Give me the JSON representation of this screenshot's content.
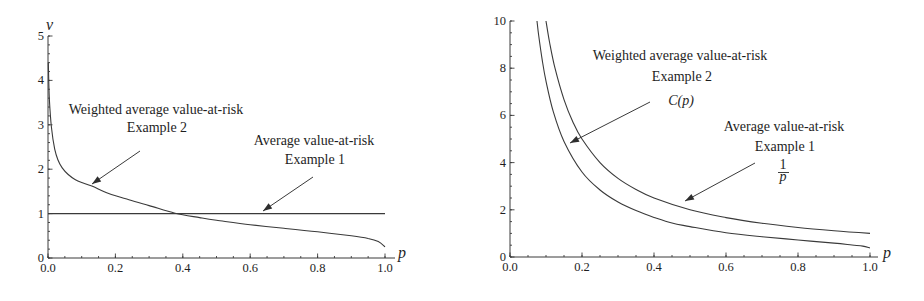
{
  "chart_data": [
    {
      "type": "line",
      "title": "",
      "xlabel": "p",
      "ylabel": "ν",
      "xlim": [
        0,
        1
      ],
      "ylim": [
        0,
        5
      ],
      "xticks": [
        0,
        0.2,
        0.4,
        0.6,
        0.8,
        1.0
      ],
      "xtick_labels": [
        "0.0",
        "0.2",
        "0.4",
        "0.6",
        "0.8",
        "1.0"
      ],
      "yticks": [
        0,
        1,
        2,
        3,
        4,
        5
      ],
      "ytick_labels": [
        "0",
        "1",
        "2",
        "3",
        "4",
        "5"
      ],
      "x_minor_step": 0.05,
      "y_minor_step": 0.2,
      "grid": false,
      "legend": "none",
      "series": [
        {
          "id": "weighted-avar-example-2",
          "name": "Weighted average value-at-risk (Example 2)",
          "x": [
            0.001,
            0.004,
            0.01,
            0.02,
            0.03,
            0.042,
            0.06,
            0.08,
            0.1,
            0.13,
            0.18,
            0.24,
            0.3,
            0.377,
            0.45,
            0.5,
            0.6,
            0.7,
            0.8,
            0.9,
            0.95,
            0.98,
            1.0
          ],
          "y": [
            4.4,
            3.6,
            2.95,
            2.45,
            2.2,
            2.03,
            1.88,
            1.77,
            1.7,
            1.62,
            1.45,
            1.31,
            1.18,
            1.01,
            0.91,
            0.85,
            0.75,
            0.67,
            0.59,
            0.5,
            0.44,
            0.37,
            0.25
          ]
        },
        {
          "id": "avar-example-1",
          "name": "Average value-at-risk (Example 1)",
          "x": [
            0,
            1
          ],
          "y": [
            1,
            1
          ]
        }
      ],
      "annotations": [
        {
          "lines": [
            "Weighted average value-at-risk",
            "Example 2"
          ],
          "points_to": "weighted-avar-example-2"
        },
        {
          "lines": [
            "Average value-at-risk",
            "Example 1"
          ],
          "points_to": "avar-example-1"
        }
      ]
    },
    {
      "type": "line",
      "title": "",
      "xlabel": "p",
      "ylabel": "",
      "xlim": [
        0,
        1
      ],
      "ylim": [
        0,
        10
      ],
      "xticks": [
        0,
        0.2,
        0.4,
        0.6,
        0.8,
        1.0
      ],
      "xtick_labels": [
        "0.0",
        "0.2",
        "0.4",
        "0.6",
        "0.8",
        "1.0"
      ],
      "yticks": [
        0,
        2,
        4,
        6,
        8,
        10
      ],
      "ytick_labels": [
        "0",
        "2",
        "4",
        "6",
        "8",
        "10"
      ],
      "x_minor_step": 0.05,
      "y_minor_step": 0.5,
      "grid": false,
      "legend": "none",
      "series": [
        {
          "id": "weighted-avar-example-2-Cp",
          "name": "Weighted average value-at-risk (Example 2): C(p)",
          "x": [
            0.075,
            0.08,
            0.09,
            0.1,
            0.12,
            0.15,
            0.2,
            0.25,
            0.3,
            0.35,
            0.4,
            0.45,
            0.5,
            0.6,
            0.7,
            0.8,
            0.9,
            0.95,
            0.98,
            1.0
          ],
          "y": [
            10.0,
            9.35,
            8.3,
            7.45,
            6.17,
            4.9,
            3.6,
            2.84,
            2.33,
            1.97,
            1.68,
            1.44,
            1.29,
            1.03,
            0.86,
            0.72,
            0.59,
            0.51,
            0.46,
            0.38
          ]
        },
        {
          "id": "avar-example-1-inverse-p",
          "name": "Average value-at-risk (Example 1): 1/p",
          "x": [
            0.1,
            0.11,
            0.125,
            0.15,
            0.175,
            0.2,
            0.25,
            0.3,
            0.35,
            0.4,
            0.5,
            0.6,
            0.7,
            0.8,
            0.9,
            1.0
          ],
          "y": [
            10.0,
            9.09,
            8.0,
            6.67,
            5.71,
            5.0,
            4.0,
            3.33,
            2.86,
            2.5,
            2.0,
            1.67,
            1.43,
            1.25,
            1.11,
            1.0
          ]
        }
      ],
      "annotations": [
        {
          "lines": [
            "Weighted average value-at-risk",
            "Example 2"
          ],
          "formula": "C(p)",
          "points_to": "weighted-avar-example-2-Cp"
        },
        {
          "lines": [
            "Average value-at-risk",
            "Example 1"
          ],
          "formula": {
            "numerator": "1",
            "denominator": "p"
          },
          "points_to": "avar-example-1-inverse-p"
        }
      ]
    }
  ]
}
